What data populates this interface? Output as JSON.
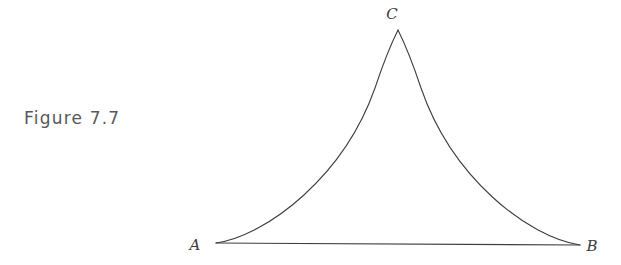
{
  "page": {
    "width": 621,
    "height": 265,
    "background": "#ffffff"
  },
  "caption": {
    "text": "Figure 7.7",
    "color": "#58585a"
  },
  "figure": {
    "name": "curvilinear-triangle",
    "stroke_color": "#3f3f41",
    "stroke_width": 1.1,
    "fill": "none",
    "vertices": [
      {
        "id": "A",
        "label": "A",
        "x": 216,
        "y": 243,
        "label_x": 195,
        "label_y": 250
      },
      {
        "id": "B",
        "label": "B",
        "x": 580,
        "y": 245,
        "label_x": 592,
        "label_y": 251
      },
      {
        "id": "C",
        "label": "C",
        "x": 398,
        "y": 30,
        "label_x": 392,
        "label_y": 19
      }
    ],
    "edges": [
      {
        "id": "AB",
        "from": "A",
        "to": "B",
        "type": "line"
      },
      {
        "id": "AC",
        "from": "A",
        "to": "C",
        "type": "curve",
        "concavity": "concave-toward-interior"
      },
      {
        "id": "CB",
        "from": "C",
        "to": "B",
        "type": "curve",
        "concavity": "concave-toward-interior"
      }
    ],
    "paths": {
      "base": "M 216 243 L 580 245",
      "left_side": "M 216 243 C 268 235, 344 176, 375 88 C 385 58, 393 40, 398 30",
      "right_side": "M 398 30 C 403 40, 411 58, 421 88 C 452 178, 528 237, 580 245"
    }
  }
}
